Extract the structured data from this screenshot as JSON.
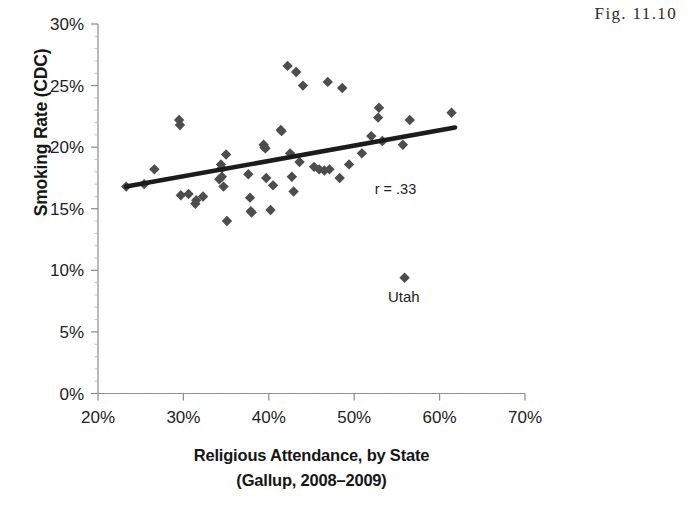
{
  "figure": {
    "number_label": "Fig. 11.10"
  },
  "chart_data": {
    "type": "scatter",
    "title": "",
    "xlabel_line1": "Religious Attendance, by State",
    "xlabel_line2": "(Gallup, 2008–2009)",
    "ylabel": "Smoking Rate (CDC)",
    "xlim": [
      20,
      70
    ],
    "ylim": [
      0,
      30
    ],
    "xticks": [
      20,
      30,
      40,
      50,
      60,
      70
    ],
    "yticks": [
      0,
      5,
      10,
      15,
      20,
      25,
      30
    ],
    "xtick_labels": [
      "20%",
      "30%",
      "40%",
      "50%",
      "60%",
      "70%"
    ],
    "ytick_labels": [
      "0%",
      "5%",
      "10%",
      "15%",
      "20%",
      "25%",
      "30%"
    ],
    "grid": false,
    "legend": "none",
    "marker": "diamond",
    "marker_color": "#4d4d4d",
    "annotations": [
      {
        "name": "correlation",
        "text": "r = .33",
        "x": 52.4,
        "y": 16.2
      },
      {
        "name": "utah-label",
        "text": "Utah",
        "x": 55.8,
        "y": 7.4
      }
    ],
    "trendline": {
      "color": "#1c1c1c",
      "x_start": 23.3,
      "y_start": 16.8,
      "x_end": 61.8,
      "y_end": 21.6
    },
    "points": [
      {
        "x": 23.3,
        "y": 16.8
      },
      {
        "x": 25.4,
        "y": 17.0
      },
      {
        "x": 26.6,
        "y": 18.2
      },
      {
        "x": 29.5,
        "y": 22.2
      },
      {
        "x": 29.6,
        "y": 21.8
      },
      {
        "x": 29.7,
        "y": 16.1
      },
      {
        "x": 30.6,
        "y": 16.2
      },
      {
        "x": 31.4,
        "y": 15.4
      },
      {
        "x": 31.5,
        "y": 15.7
      },
      {
        "x": 32.3,
        "y": 16.0
      },
      {
        "x": 34.2,
        "y": 17.4
      },
      {
        "x": 34.4,
        "y": 18.6
      },
      {
        "x": 34.5,
        "y": 18.3
      },
      {
        "x": 34.5,
        "y": 17.6
      },
      {
        "x": 34.7,
        "y": 16.8
      },
      {
        "x": 35.0,
        "y": 19.4
      },
      {
        "x": 35.1,
        "y": 14.0
      },
      {
        "x": 37.6,
        "y": 17.8
      },
      {
        "x": 37.8,
        "y": 15.9
      },
      {
        "x": 37.9,
        "y": 14.8
      },
      {
        "x": 38.0,
        "y": 14.7
      },
      {
        "x": 39.4,
        "y": 20.2
      },
      {
        "x": 39.5,
        "y": 20.0
      },
      {
        "x": 39.6,
        "y": 19.9
      },
      {
        "x": 39.7,
        "y": 17.5
      },
      {
        "x": 40.2,
        "y": 14.9
      },
      {
        "x": 40.5,
        "y": 16.9
      },
      {
        "x": 41.4,
        "y": 21.4
      },
      {
        "x": 41.5,
        "y": 21.3
      },
      {
        "x": 42.2,
        "y": 26.6
      },
      {
        "x": 42.5,
        "y": 19.5
      },
      {
        "x": 42.7,
        "y": 17.6
      },
      {
        "x": 42.9,
        "y": 16.4
      },
      {
        "x": 43.2,
        "y": 26.1
      },
      {
        "x": 43.6,
        "y": 18.8
      },
      {
        "x": 44.0,
        "y": 25.0
      },
      {
        "x": 45.3,
        "y": 18.4
      },
      {
        "x": 45.9,
        "y": 18.2
      },
      {
        "x": 46.5,
        "y": 18.1
      },
      {
        "x": 46.9,
        "y": 25.3
      },
      {
        "x": 47.1,
        "y": 18.2
      },
      {
        "x": 48.3,
        "y": 17.5
      },
      {
        "x": 48.6,
        "y": 24.8
      },
      {
        "x": 49.4,
        "y": 18.6
      },
      {
        "x": 50.9,
        "y": 19.5
      },
      {
        "x": 52.0,
        "y": 20.9
      },
      {
        "x": 52.8,
        "y": 22.4
      },
      {
        "x": 52.9,
        "y": 23.2
      },
      {
        "x": 53.3,
        "y": 20.5
      },
      {
        "x": 55.7,
        "y": 20.2
      },
      {
        "x": 55.9,
        "y": 9.4
      },
      {
        "x": 56.5,
        "y": 22.2
      },
      {
        "x": 61.4,
        "y": 22.8
      }
    ]
  }
}
